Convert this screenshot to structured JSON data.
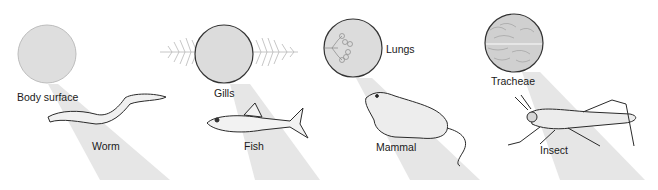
{
  "diagram": {
    "panels": [
      {
        "organ_label": "Body surface",
        "animal_label": "Worm"
      },
      {
        "organ_label": "Gills",
        "animal_label": "Fish"
      },
      {
        "organ_label": "Lungs",
        "animal_label": "Mammal"
      },
      {
        "organ_label": "Tracheae",
        "animal_label": "Insect"
      }
    ],
    "colors": {
      "beam": "#e3e3e3",
      "circle_fill": "#dcdcdc",
      "circle_stroke": "#333333",
      "line": "#2a2a2a"
    }
  }
}
